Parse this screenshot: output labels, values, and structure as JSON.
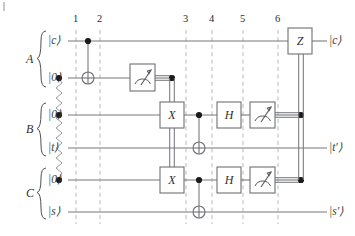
{
  "figure": {
    "kind": "quantum-circuit-diagram",
    "corner_mark": "|"
  },
  "groups": [
    {
      "id": "A",
      "label": "A"
    },
    {
      "id": "B",
      "label": "B"
    },
    {
      "id": "C",
      "label": "C"
    }
  ],
  "columns": [
    {
      "label": "1",
      "x": 76
    },
    {
      "label": "2",
      "x": 100
    },
    {
      "label": "3",
      "x": 186
    },
    {
      "label": "4",
      "x": 212
    },
    {
      "label": "5",
      "x": 243
    },
    {
      "label": "6",
      "x": 278
    }
  ],
  "wires": [
    {
      "id": "A0",
      "group": "A",
      "input": "|c⟩",
      "output": "|c⟩",
      "y": 41
    },
    {
      "id": "A1",
      "group": "A",
      "input": "|0⟩",
      "output": "",
      "y": 78
    },
    {
      "id": "B0",
      "group": "B",
      "input": "|0⟩",
      "output": "",
      "y": 115
    },
    {
      "id": "B1",
      "group": "B",
      "input": "|t⟩",
      "output": "|t′⟩",
      "y": 148
    },
    {
      "id": "C0",
      "group": "C",
      "input": "|0⟩",
      "output": "",
      "y": 180
    },
    {
      "id": "C1",
      "group": "C",
      "input": "|s⟩",
      "output": "|s′⟩",
      "y": 212
    }
  ],
  "gates": [
    {
      "name": "cnot-a",
      "type": "cnot",
      "control_wire": "A0",
      "target_wire": "A1",
      "x": 88
    },
    {
      "name": "meter-a1",
      "type": "measure",
      "wire": "A1",
      "x": 142,
      "symbol": "meter"
    },
    {
      "name": "x-gate-b",
      "type": "x",
      "label": "X",
      "wire": "B0",
      "x": 172
    },
    {
      "name": "x-gate-c",
      "type": "x",
      "label": "X",
      "wire": "C0",
      "x": 172
    },
    {
      "name": "cnot-b",
      "type": "cnot",
      "control_wire": "B0",
      "target_wire": "B1",
      "x": 199
    },
    {
      "name": "cnot-c",
      "type": "cnot",
      "control_wire": "C0",
      "target_wire": "C1",
      "x": 199
    },
    {
      "name": "h-gate-b",
      "type": "h",
      "label": "H",
      "wire": "B0",
      "x": 229
    },
    {
      "name": "h-gate-c",
      "type": "h",
      "label": "H",
      "wire": "C0",
      "x": 229
    },
    {
      "name": "meter-b0",
      "type": "measure",
      "wire": "B0",
      "x": 262,
      "symbol": "meter"
    },
    {
      "name": "meter-c0",
      "type": "measure",
      "wire": "C0",
      "x": 262,
      "symbol": "meter"
    },
    {
      "name": "z-gate-a",
      "type": "z",
      "label": "Z",
      "wire": "A0",
      "x": 300
    }
  ],
  "entanglement": {
    "name": "entanglement-squiggle",
    "x": 59,
    "nodes": [
      "A1",
      "B0",
      "C0"
    ]
  },
  "classical_links": [
    {
      "name": "classical-a1-to-x",
      "from": "meter-a1",
      "to": "x-gate-b"
    },
    {
      "name": "classical-b0-to-z",
      "from": "meter-b0",
      "to": "z-gate-a"
    },
    {
      "name": "classical-c0-to-z",
      "from": "meter-c0",
      "to": "z-gate-a"
    }
  ]
}
